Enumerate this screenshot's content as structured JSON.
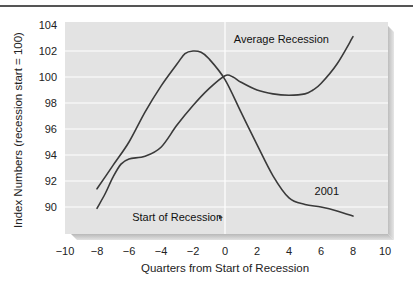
{
  "chart_data": {
    "type": "line",
    "title": "",
    "xlabel": "Quarters from Start of Recession",
    "ylabel": "Index Numbers (recession start = 100)",
    "xlim": [
      -10,
      10
    ],
    "ylim": [
      88,
      104.3
    ],
    "xticks": [
      -10,
      -8,
      -6,
      -4,
      -2,
      0,
      2,
      4,
      6,
      8,
      10
    ],
    "xtick_labels": [
      "−10",
      "−8",
      "−6",
      "−4",
      "−2",
      "0",
      "2",
      "4",
      "6",
      "8",
      "10"
    ],
    "yticks": [
      90,
      92,
      94,
      96,
      98,
      100,
      102,
      104
    ],
    "ytick_labels": [
      "90",
      "92",
      "94",
      "96",
      "98",
      "100",
      "102",
      "104"
    ],
    "grid": {
      "horizontal": true,
      "vertical": false
    },
    "reference_line": {
      "x": 0,
      "label": "Start of Recession"
    },
    "legend": "inline-labels",
    "series": [
      {
        "name": "2001",
        "x": [
          -8,
          -7,
          -6,
          -5,
          -4,
          -3,
          -2.5,
          -2,
          -1.5,
          -1,
          0,
          1,
          2,
          3,
          4,
          5,
          6,
          7,
          8
        ],
        "values": [
          91.4,
          93.2,
          95.0,
          97.3,
          99.3,
          101.0,
          101.8,
          102.0,
          101.9,
          101.4,
          99.8,
          97.3,
          94.8,
          92.4,
          90.7,
          90.2,
          90.0,
          89.7,
          89.3
        ]
      },
      {
        "name": "Average Recession",
        "x": [
          -8,
          -7.5,
          -7,
          -6.5,
          -6,
          -5,
          -4,
          -3,
          -2,
          -1,
          0,
          0.5,
          1,
          2,
          3,
          4,
          5,
          5.5,
          6,
          7,
          8
        ],
        "values": [
          89.9,
          91.0,
          92.3,
          93.3,
          93.7,
          93.9,
          94.6,
          96.3,
          97.8,
          99.1,
          100.1,
          100.0,
          99.6,
          99.0,
          98.7,
          98.6,
          98.7,
          99.0,
          99.5,
          101.0,
          103.1
        ]
      }
    ],
    "annotations": [
      {
        "text": "Average Recession",
        "x": 4.8,
        "y": 102.6
      },
      {
        "text": "2001",
        "x": 5.6,
        "y": 90.9
      },
      {
        "text": "Start of Recession",
        "x": -5.8,
        "y": 88.9
      }
    ]
  }
}
